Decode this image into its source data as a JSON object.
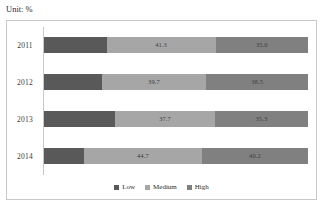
{
  "unit_caption": "Unit: %",
  "legend": {
    "position": "bottom-center",
    "items": [
      {
        "label": "Low",
        "color": "#595959",
        "swatch_icon": "square-swatch-icon"
      },
      {
        "label": "Medium",
        "color": "#a6a6a6",
        "swatch_icon": "square-swatch-icon"
      },
      {
        "label": "High",
        "color": "#808080",
        "swatch_icon": "square-swatch-icon"
      }
    ]
  },
  "rows": [
    {
      "category": "2011",
      "low": {
        "value": 23.7,
        "label": ""
      },
      "medium": {
        "value": 41.3,
        "label": "41.3"
      },
      "high": {
        "value": 35.0,
        "label": "35.0"
      }
    },
    {
      "category": "2012",
      "low": {
        "value": 21.8,
        "label": ""
      },
      "medium": {
        "value": 39.7,
        "label": "39.7"
      },
      "high": {
        "value": 38.5,
        "label": "38.5"
      }
    },
    {
      "category": "2013",
      "low": {
        "value": 27.0,
        "label": ""
      },
      "medium": {
        "value": 37.7,
        "label": "37.7"
      },
      "high": {
        "value": 35.3,
        "label": "35.3"
      }
    },
    {
      "category": "2014",
      "low": {
        "value": 15.1,
        "label": ""
      },
      "medium": {
        "value": 44.7,
        "label": "44.7"
      },
      "high": {
        "value": 40.2,
        "label": "40.2"
      }
    }
  ],
  "chart_data": {
    "type": "bar",
    "subtype": "stacked-horizontal-100-percent",
    "title": "",
    "subtitle": "",
    "unit": "Unit: %",
    "xlabel": "",
    "ylabel": "",
    "orientation": "horizontal",
    "stacked": true,
    "grid": false,
    "legend_position": "bottom-center",
    "xlim": [
      0,
      100
    ],
    "categories": [
      "2011",
      "2012",
      "2013",
      "2014"
    ],
    "series": [
      {
        "name": "Low",
        "color": "#595959",
        "values": [
          23.7,
          21.8,
          27.0,
          15.1
        ],
        "labels_shown": false
      },
      {
        "name": "Medium",
        "color": "#a6a6a6",
        "values": [
          41.3,
          39.7,
          37.7,
          44.7
        ],
        "labels_shown": true
      },
      {
        "name": "High",
        "color": "#808080",
        "values": [
          35.0,
          38.5,
          35.3,
          40.2
        ],
        "labels_shown": true
      }
    ]
  }
}
